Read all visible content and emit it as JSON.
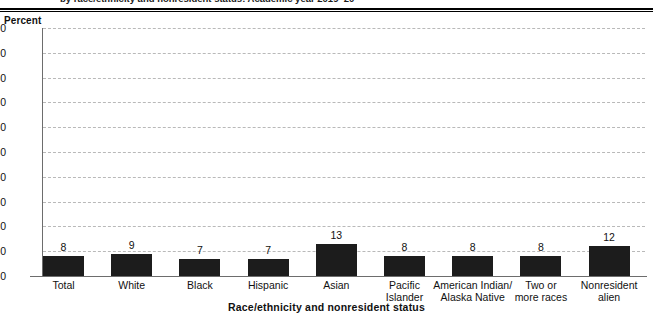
{
  "figure": {
    "cut_title": "by race/ethnicity and nonresident status: Academic year 2019–20"
  },
  "chart_data": {
    "type": "bar",
    "title": "",
    "xlabel": "Race/ethnicity and nonresident status",
    "ylabel": "Percent",
    "ylim": [
      0,
      100
    ],
    "yticks": [
      100,
      90,
      80,
      70,
      60,
      50,
      40,
      30,
      20,
      10,
      0
    ],
    "grid": true,
    "legend": "none",
    "bar_color": "#1c1c1c",
    "categories": [
      "Total",
      "White",
      "Black",
      "Hispanic",
      "Asian",
      "Pacific Islander",
      "American Indian/ Alaska Native",
      "Two or more races",
      "Nonresident alien"
    ],
    "category_lines": [
      [
        "Total"
      ],
      [
        "White"
      ],
      [
        "Black"
      ],
      [
        "Hispanic"
      ],
      [
        "Asian"
      ],
      [
        "Pacific",
        "Islander"
      ],
      [
        "American Indian/",
        "Alaska Native"
      ],
      [
        "Two or",
        "more races"
      ],
      [
        "Nonresident",
        "alien"
      ]
    ],
    "values": [
      8,
      9,
      7,
      7,
      13,
      8,
      8,
      8,
      12
    ],
    "value_labels": [
      "8",
      "9",
      "7",
      "7",
      "13",
      "8",
      "8",
      "8",
      "12"
    ]
  }
}
